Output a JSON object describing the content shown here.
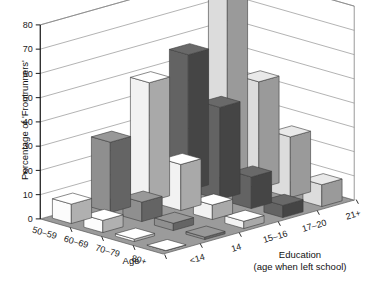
{
  "chart_data": {
    "type": "bar",
    "title": "",
    "subtitle": "",
    "ylabel": "Percentage of 'Frontrunners'",
    "xlabel": "Age",
    "zlabel": "Education",
    "zlabel_sub": "(age when left school)",
    "ylim": [
      0,
      80
    ],
    "yticks": [
      0,
      10,
      20,
      30,
      40,
      50,
      60,
      70,
      80
    ],
    "ytick_labels": [
      "0",
      "10",
      "20",
      "30",
      "40",
      "50",
      "60",
      "70",
      "80"
    ],
    "grid": true,
    "legend": "none",
    "categories": [
      "50–59",
      "60–69",
      "70–79",
      "80+"
    ],
    "depth_categories": [
      "<14",
      "14",
      "15–16",
      "17–20",
      "21+"
    ],
    "series": [
      {
        "name": "<14",
        "values": [
          8,
          5,
          1,
          0
        ]
      },
      {
        "name": "14",
        "values": [
          29,
          8,
          3,
          1
        ]
      },
      {
        "name": "15–16",
        "values": [
          49,
          19,
          6,
          3
        ]
      },
      {
        "name": "17–20",
        "values": [
          56,
          38,
          13,
          5
        ]
      },
      {
        "name": "21+",
        "values": [
          76,
          44,
          25,
          9
        ]
      }
    ],
    "series_fill_colors": [
      "#fcfcfc",
      "#8f8f8f",
      "#f2f2f2",
      "#636363",
      "#dcdcdc"
    ],
    "floor_color": "#9b9b9b",
    "wall_color": "#ffffff",
    "grid_color": "#8a8a8a",
    "axis_color": "#1a1a1a"
  },
  "axes": {
    "y_title": "Percentage of 'Frontrunners'",
    "x_title": "Age",
    "z_title": "Education",
    "z_title_sub": "(age when left school)"
  }
}
